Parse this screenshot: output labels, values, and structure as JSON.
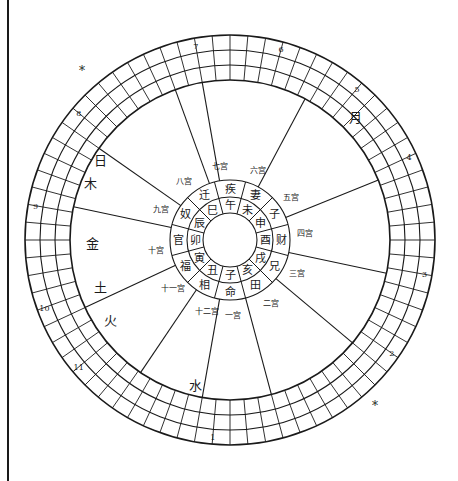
{
  "chart_title": "",
  "center": {
    "branches": [
      "子",
      "丑",
      "寅",
      "卯",
      "辰",
      "巳",
      "午",
      "未",
      "申",
      "酉",
      "戌",
      "亥"
    ],
    "palaces": [
      "命",
      "相",
      "福",
      "官",
      "奴",
      "迁",
      "疾",
      "妻",
      "子",
      "财",
      "兄",
      "田"
    ]
  },
  "house_labels": [
    "一宫",
    "十二宫",
    "十一宫",
    "十宫",
    "九宫",
    "八宫",
    "七宫",
    "六宫",
    "五宫",
    "四宫",
    "三宫",
    "二宫"
  ],
  "planets": [
    {
      "name": "日",
      "label": "日"
    },
    {
      "name": "木",
      "label": "木"
    },
    {
      "name": "月",
      "label": "月"
    },
    {
      "name": "金",
      "label": "金"
    },
    {
      "name": "土",
      "label": "土"
    },
    {
      "name": "火",
      "label": "火"
    },
    {
      "name": "水",
      "label": "水"
    }
  ],
  "ring_numbers": [
    "1",
    "2",
    "3",
    "4",
    "5",
    "6",
    "7",
    "8",
    "9",
    "10",
    "11"
  ],
  "stars_marks": [
    "*",
    "*"
  ]
}
